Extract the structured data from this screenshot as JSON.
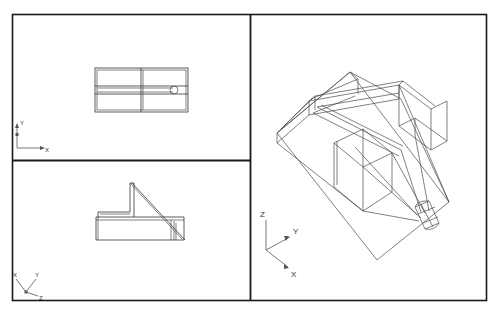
{
  "application": {
    "window_title": "CAD Viewport Layout",
    "background_color": "#ffffff",
    "frame_color": "#1a1a1a",
    "line_color": "#4a4a4a"
  },
  "layout": {
    "frame": {
      "x": 12,
      "y": 14,
      "width": 475,
      "height": 287
    },
    "vertical_divider_x": 250,
    "horizontal_divider_y": 160,
    "viewport_count": 3
  },
  "viewports": [
    {
      "id": "top-view",
      "name": "Top View",
      "position": "top-left",
      "projection": "orthographic",
      "ucs": {
        "type": "2d",
        "axes": [
          {
            "label": "Y",
            "direction": "up"
          },
          {
            "label": "X",
            "direction": "right"
          }
        ],
        "origin_x": 16,
        "origin_y": 148
      },
      "geometry_description": "Rectangular plan outline with internal horizontal rib and a rounded-end slot terminating in a circular arc"
    },
    {
      "id": "front-view",
      "name": "Front View",
      "position": "bottom-left",
      "projection": "orthographic",
      "ucs": {
        "type": "3d",
        "axes": [
          {
            "label": "X",
            "direction": "upper-left"
          },
          {
            "label": "Y",
            "direction": "upper-right"
          },
          {
            "label": "Z",
            "direction": "lower-right"
          }
        ],
        "origin_x": 26,
        "origin_y": 292
      },
      "geometry_description": "Side profile with a flat base slab, an upright vertical flange and a sloping hypotenuse forming a wedge"
    },
    {
      "id": "isometric-view",
      "name": "Isometric View",
      "position": "right",
      "projection": "isometric",
      "ucs": {
        "type": "3d",
        "axes": [
          {
            "label": "Z",
            "direction": "up"
          },
          {
            "label": "Y",
            "direction": "upper-right"
          },
          {
            "label": "X",
            "direction": "lower-right"
          }
        ],
        "origin_x": 266,
        "origin_y": 250
      },
      "geometry_description": "3D wireframe of a channel-section wedge block with interior ribs, an inclined ramp face and a cylindrical boss"
    }
  ],
  "labels": {
    "x": "X",
    "y": "Y",
    "z": "Z"
  }
}
